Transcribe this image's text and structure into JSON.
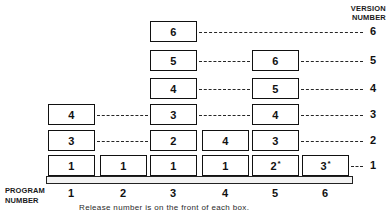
{
  "figure": {
    "version_axis_title": "VERSION\nNUMBER",
    "version_axis_title_line1": "VERSION",
    "version_axis_title_line2": "NUMBER",
    "program_axis_title_line1": "PROGRAM",
    "program_axis_title_line2": "NUMBER",
    "caption": "Release number is on the front of each box."
  },
  "version_ticks": [
    {
      "label": "6"
    },
    {
      "label": "5"
    },
    {
      "label": "4"
    },
    {
      "label": "3"
    },
    {
      "label": "2"
    },
    {
      "label": "1"
    }
  ],
  "program_ticks": [
    {
      "label": "1"
    },
    {
      "label": "2"
    },
    {
      "label": "3"
    },
    {
      "label": "4"
    },
    {
      "label": "5"
    },
    {
      "label": "6"
    }
  ],
  "boxes": [
    {
      "program": 3,
      "version": 6,
      "release": "6",
      "starred": false
    },
    {
      "program": 3,
      "version": 5,
      "release": "5",
      "starred": false
    },
    {
      "program": 5,
      "version": 5,
      "release": "6",
      "starred": false
    },
    {
      "program": 3,
      "version": 4,
      "release": "4",
      "starred": false
    },
    {
      "program": 5,
      "version": 4,
      "release": "5",
      "starred": false
    },
    {
      "program": 1,
      "version": 3,
      "release": "4",
      "starred": false
    },
    {
      "program": 3,
      "version": 3,
      "release": "3",
      "starred": false
    },
    {
      "program": 5,
      "version": 3,
      "release": "4",
      "starred": false
    },
    {
      "program": 1,
      "version": 2,
      "release": "3",
      "starred": false
    },
    {
      "program": 3,
      "version": 2,
      "release": "2",
      "starred": false
    },
    {
      "program": 4,
      "version": 2,
      "release": "4",
      "starred": false
    },
    {
      "program": 5,
      "version": 2,
      "release": "3",
      "starred": false
    },
    {
      "program": 1,
      "version": 1,
      "release": "1",
      "starred": false
    },
    {
      "program": 2,
      "version": 1,
      "release": "1",
      "starred": false
    },
    {
      "program": 3,
      "version": 1,
      "release": "1",
      "starred": false
    },
    {
      "program": 4,
      "version": 1,
      "release": "1",
      "starred": false
    },
    {
      "program": 5,
      "version": 1,
      "release": "2",
      "starred": true
    },
    {
      "program": 6,
      "version": 1,
      "release": "3",
      "starred": true
    }
  ],
  "chart_data": {
    "type": "table",
    "xlabel": "PROGRAM NUMBER",
    "ylabel": "VERSION NUMBER",
    "categories": [
      "1",
      "2",
      "3",
      "4",
      "5",
      "6"
    ],
    "rows": [
      {
        "version": "6",
        "cells": [
          "",
          "",
          "6",
          "",
          "",
          ""
        ]
      },
      {
        "version": "5",
        "cells": [
          "",
          "",
          "5",
          "",
          "6",
          ""
        ]
      },
      {
        "version": "4",
        "cells": [
          "",
          "",
          "4",
          "",
          "5",
          ""
        ]
      },
      {
        "version": "3",
        "cells": [
          "4",
          "",
          "3",
          "",
          "4",
          ""
        ]
      },
      {
        "version": "2",
        "cells": [
          "3",
          "",
          "2",
          "4",
          "3",
          ""
        ]
      },
      {
        "version": "1",
        "cells": [
          "1",
          "1",
          "1",
          "1",
          "2*",
          "3*"
        ]
      }
    ],
    "note": "Release number is on the front of each box.",
    "grid": false,
    "legend": "none"
  },
  "colors": {
    "box_border": "#111111",
    "box_fill": "#ffffff",
    "dash": "#262626",
    "text": "#111111",
    "shelf_fill": "#f2f2f2",
    "background": "#ffffff"
  }
}
